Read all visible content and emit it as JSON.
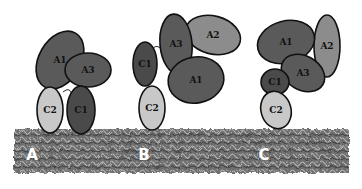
{
  "colors": {
    "dark": "#5a5a5a",
    "darker": "#4a4a4a",
    "medium": "#8c8c8c",
    "light": "#c8c8c8",
    "outline": "#111111",
    "membrane": "#6e6e6e"
  },
  "panels": [
    {
      "label": "A",
      "domains": [
        {
          "name": "A1",
          "cx": 60,
          "cy": 60,
          "rx": 21,
          "ry": 31,
          "rot": 30,
          "fill": "#5a5a5a"
        },
        {
          "name": "A3",
          "cx": 88,
          "cy": 70,
          "rx": 23,
          "ry": 17,
          "rot": 0,
          "fill": "#5a5a5a"
        },
        {
          "name": "C2",
          "cx": 50,
          "cy": 110,
          "rx": 13,
          "ry": 23,
          "rot": 0,
          "fill": "#c8c8c8"
        },
        {
          "name": "C1",
          "cx": 81,
          "cy": 110,
          "rx": 14,
          "ry": 24,
          "rot": 0,
          "fill": "#4a4a4a"
        }
      ]
    },
    {
      "label": "B",
      "domains": [
        {
          "name": "A2",
          "cx": 213,
          "cy": 35,
          "rx": 28,
          "ry": 19,
          "rot": 15,
          "fill": "#8c8c8c"
        },
        {
          "name": "C1",
          "cx": 145,
          "cy": 64,
          "rx": 12,
          "ry": 22,
          "rot": 0,
          "fill": "#4a4a4a"
        },
        {
          "name": "A3",
          "cx": 176,
          "cy": 44,
          "rx": 16,
          "ry": 30,
          "rot": -5,
          "fill": "#5a5a5a"
        },
        {
          "name": "A1",
          "cx": 196,
          "cy": 80,
          "rx": 28,
          "ry": 23,
          "rot": -10,
          "fill": "#5a5a5a"
        },
        {
          "name": "C2",
          "cx": 152,
          "cy": 108,
          "rx": 13,
          "ry": 22,
          "rot": 0,
          "fill": "#c8c8c8"
        }
      ]
    },
    {
      "label": "C",
      "domains": [
        {
          "name": "A2",
          "cx": 327,
          "cy": 46,
          "rx": 13,
          "ry": 31,
          "rot": 0,
          "fill": "#8c8c8c"
        },
        {
          "name": "A1",
          "cx": 286,
          "cy": 42,
          "rx": 29,
          "ry": 21,
          "rot": -15,
          "fill": "#5a5a5a"
        },
        {
          "name": "A3",
          "cx": 303,
          "cy": 73,
          "rx": 23,
          "ry": 17,
          "rot": 30,
          "fill": "#5a5a5a"
        },
        {
          "name": "C1",
          "cx": 275,
          "cy": 82,
          "rx": 14,
          "ry": 13,
          "rot": 0,
          "fill": "#4a4a4a"
        },
        {
          "name": "C2",
          "cx": 276,
          "cy": 110,
          "rx": 15,
          "ry": 19,
          "rot": -15,
          "fill": "#c8c8c8"
        }
      ]
    }
  ]
}
